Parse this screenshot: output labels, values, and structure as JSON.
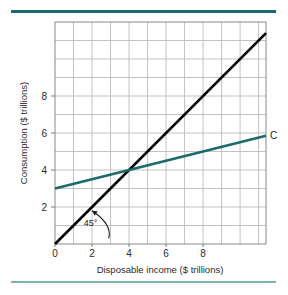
{
  "figure": {
    "background_color": "#ffffff",
    "top_rule_color": "#1b6b6b",
    "bottom_rule_color": "#7fb3b3"
  },
  "chart_data": {
    "type": "line",
    "title": "",
    "xlabel": "Disposable income ($ trillions)",
    "ylabel": "Consumption ($ trillions)",
    "xlim": [
      0,
      11.4
    ],
    "ylim": [
      0,
      12
    ],
    "grid": true,
    "grid_step_x": 1,
    "grid_step_y": 1,
    "xticks": [
      0,
      2,
      4,
      6,
      8
    ],
    "xtick_labels": [
      "0",
      "2",
      "4",
      "6",
      "8"
    ],
    "yticks": [
      2,
      4,
      6,
      8
    ],
    "ytick_labels": [
      "2",
      "4",
      "6",
      "8"
    ],
    "legend_position": "inline-right",
    "series": [
      {
        "name": "45-degree line",
        "label": "45°",
        "color": "#000000",
        "width": 2.6,
        "points": [
          [
            0,
            0
          ],
          [
            11.4,
            11.4
          ]
        ]
      },
      {
        "name": "Consumption function",
        "label": "C",
        "color": "#1b6b6b",
        "width": 2.4,
        "points": [
          [
            0,
            3.0
          ],
          [
            11.4,
            5.85
          ]
        ],
        "intercept": 3.0,
        "slope": 0.25
      }
    ],
    "intersection": {
      "x": 4,
      "y": 4
    },
    "annotations": [
      {
        "name": "forty-five-degree-annotation",
        "text": "45°",
        "x": 1.55,
        "y": 1.0,
        "arrow_from": [
          2.9,
          0.3
        ],
        "arrow_to": [
          2.0,
          1.8
        ]
      }
    ]
  },
  "labels": {
    "series_c": "C",
    "angle": "45°",
    "x_axis_title": "Disposable income ($ trillions)",
    "y_axis_title": "Consumption ($ trillions)"
  }
}
